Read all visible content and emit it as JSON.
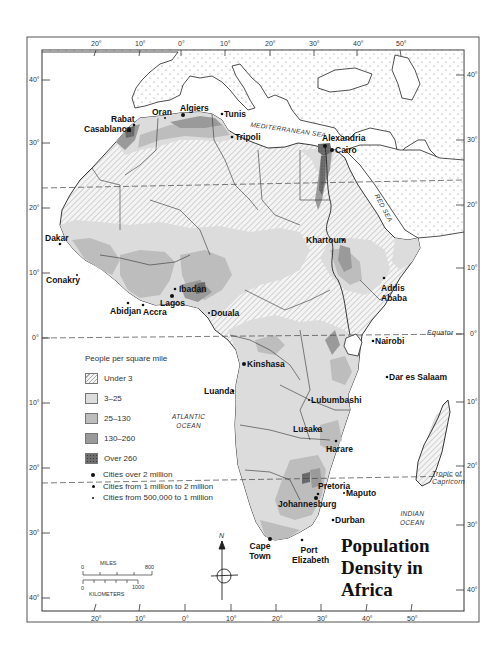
{
  "map": {
    "title_lines": [
      "Population",
      "Density in",
      "Africa"
    ],
    "legend": {
      "title": "People per square mile",
      "categories": [
        {
          "label": "Under 3",
          "pattern": "hatched",
          "color": "#f2f2f2"
        },
        {
          "label": "3–25",
          "pattern": "solid",
          "color": "#dcdcdc"
        },
        {
          "label": "25–130",
          "pattern": "solid",
          "color": "#bdbdbd"
        },
        {
          "label": "130–260",
          "pattern": "solid",
          "color": "#9a9a9a"
        },
        {
          "label": "Over 260",
          "pattern": "stippled",
          "color": "#6e6e6e"
        }
      ],
      "city_sizes": [
        {
          "label": "Cities over 2 million",
          "symbol": "large-dot"
        },
        {
          "label": "Cities from 1 million to 2 million",
          "symbol": "medium-dot"
        },
        {
          "label": "Cities from 500,000 to 1 million",
          "symbol": "small-dot"
        }
      ]
    },
    "water_labels": {
      "mediterranean": "MEDITERRANEAN SEA",
      "red_sea": "RED SEA",
      "atlantic": [
        "ATLANTIC",
        "OCEAN"
      ],
      "indian": [
        "INDIAN",
        "OCEAN"
      ]
    },
    "lines": {
      "equator": "Equator",
      "capricorn": [
        "Tropic of",
        "Capricorn"
      ]
    },
    "top_longitudes": [
      "20°",
      "10°",
      "0°",
      "10°",
      "20°",
      "30°",
      "40°",
      "50°"
    ],
    "bottom_longitudes": [
      "20°",
      "10°",
      "0°",
      "10°",
      "20°",
      "30°",
      "40°",
      "50°"
    ],
    "left_latitudes": [
      "40°",
      "30°",
      "20°",
      "10°",
      "0°",
      "10°",
      "20°",
      "30°",
      "40°"
    ],
    "right_latitudes": [
      "40°",
      "30°",
      "20°",
      "10°",
      "0°",
      "10°",
      "20°",
      "30°",
      "40°"
    ],
    "compass": {
      "north_label": "N"
    },
    "scale": {
      "miles_label": "MILES",
      "miles_start": "0",
      "miles_end": "800",
      "km_label": "KILOMETERS",
      "km_start": "0",
      "km_end": "1000"
    },
    "cities": [
      {
        "name": "Rabat",
        "size": "medium"
      },
      {
        "name": "Casablanca",
        "size": "large"
      },
      {
        "name": "Oran",
        "size": "small"
      },
      {
        "name": "Algiers",
        "size": "large"
      },
      {
        "name": "Tunis",
        "size": "medium"
      },
      {
        "name": "Tripoli",
        "size": "medium"
      },
      {
        "name": "Alexandria",
        "size": "large"
      },
      {
        "name": "Cairo",
        "size": "large"
      },
      {
        "name": "Khartoum",
        "size": "medium"
      },
      {
        "name": "Dakar",
        "size": "medium"
      },
      {
        "name": "Conakry",
        "size": "small"
      },
      {
        "name": "Addis Ababa",
        "size": "medium"
      },
      {
        "name": "Ibadan",
        "size": "medium"
      },
      {
        "name": "Lagos",
        "size": "large"
      },
      {
        "name": "Abidjan",
        "size": "medium"
      },
      {
        "name": "Accra",
        "size": "medium"
      },
      {
        "name": "Douala",
        "size": "small"
      },
      {
        "name": "Nairobi",
        "size": "medium"
      },
      {
        "name": "Kinshasa",
        "size": "large"
      },
      {
        "name": "Dar es Salaam",
        "size": "medium"
      },
      {
        "name": "Luanda",
        "size": "medium"
      },
      {
        "name": "Lubumbashi",
        "size": "small"
      },
      {
        "name": "Lusaka",
        "size": "small"
      },
      {
        "name": "Harare",
        "size": "medium"
      },
      {
        "name": "Pretoria",
        "size": "medium"
      },
      {
        "name": "Maputo",
        "size": "small"
      },
      {
        "name": "Johannesburg",
        "size": "large"
      },
      {
        "name": "Durban",
        "size": "medium"
      },
      {
        "name": "Cape Town",
        "size": "large"
      },
      {
        "name": "Port Elizabeth",
        "size": "medium"
      }
    ]
  }
}
